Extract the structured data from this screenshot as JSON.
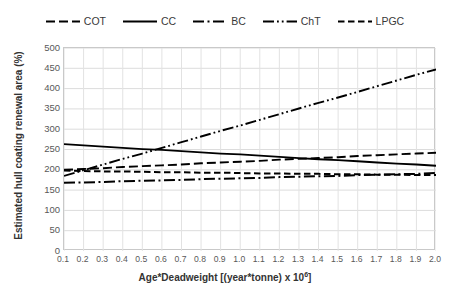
{
  "chart_data": {
    "type": "line",
    "title": "",
    "xlabel": "Age*Deadweight [(year*tonne) x 10⁶]",
    "ylabel": "Estimated hull coating renewal area (%)",
    "xlim": [
      0.1,
      2.0
    ],
    "ylim": [
      0,
      500
    ],
    "grid": true,
    "legend_position": "top",
    "x": [
      0.1,
      0.2,
      0.3,
      0.4,
      0.5,
      0.6,
      0.7,
      0.8,
      0.9,
      1.0,
      1.1,
      1.2,
      1.3,
      1.4,
      1.5,
      1.6,
      1.7,
      1.8,
      1.9,
      2.0
    ],
    "xtick_labels": [
      "0.1",
      "0.2",
      "0.3",
      "0.4",
      "0.5",
      "0.6",
      "0.7",
      "0.8",
      "0.9",
      "1.0",
      "1.1",
      "1.2",
      "1.3",
      "1.4",
      "1.5",
      "1.6",
      "1.7",
      "1.8",
      "1.9",
      "2.0"
    ],
    "ytick_labels": [
      "0",
      "50",
      "100",
      "150",
      "200",
      "250",
      "300",
      "350",
      "400",
      "450",
      "500"
    ],
    "yticks": [
      0,
      50,
      100,
      150,
      200,
      250,
      300,
      350,
      400,
      450,
      500
    ],
    "series": [
      {
        "name": "COT",
        "style": "long-dash",
        "color": "#000000",
        "dasharray": "9,4",
        "width": 1.9,
        "values": [
          200,
          202,
          204,
          207,
          209,
          211,
          213,
          216,
          218,
          220,
          222,
          225,
          227,
          229,
          231,
          234,
          236,
          238,
          240,
          242
        ]
      },
      {
        "name": "CC",
        "style": "solid",
        "color": "#000000",
        "dasharray": "",
        "width": 1.8,
        "values": [
          263,
          260,
          257,
          254,
          251,
          249,
          246,
          243,
          240,
          238,
          235,
          232,
          229,
          226,
          224,
          221,
          218,
          215,
          213,
          210
        ]
      },
      {
        "name": "BC",
        "style": "dash-dot",
        "color": "#000000",
        "dasharray": "11,3.5,2,3.5",
        "width": 2.0,
        "values": [
          168,
          169,
          170,
          172,
          173,
          174,
          175,
          177,
          178,
          179,
          180,
          182,
          183,
          184,
          185,
          187,
          188,
          189,
          190,
          192
        ]
      },
      {
        "name": "ChT",
        "style": "dash-dot-dot",
        "color": "#000000",
        "dasharray": "11,3,1.8,3,1.8,3",
        "width": 1.9,
        "values": [
          185,
          199,
          213,
          227,
          240,
          254,
          268,
          282,
          296,
          309,
          323,
          337,
          351,
          365,
          378,
          392,
          406,
          420,
          434,
          447
        ]
      },
      {
        "name": "LPGC",
        "style": "short-dash",
        "color": "#000000",
        "dasharray": "6.5,3.5",
        "width": 2.0,
        "values": [
          198,
          197,
          196,
          196,
          195,
          194,
          194,
          193,
          193,
          192,
          191,
          191,
          190,
          190,
          189,
          189,
          188,
          188,
          187,
          187
        ]
      }
    ]
  },
  "legend": {
    "items": [
      {
        "label": "COT"
      },
      {
        "label": "CC"
      },
      {
        "label": "BC"
      },
      {
        "label": "ChT"
      },
      {
        "label": "LPGC"
      }
    ]
  }
}
